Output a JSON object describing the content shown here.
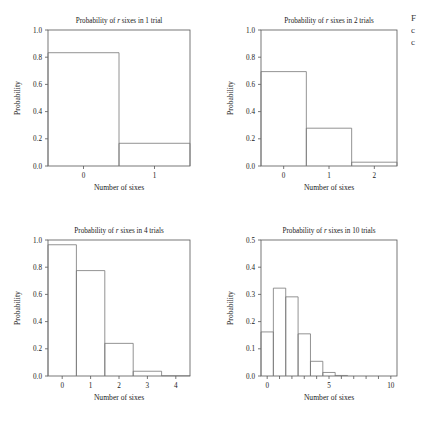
{
  "figure": {
    "background": "#ffffff",
    "stroke_color": "#555555",
    "bar_stroke_color": "#777777"
  },
  "edge_fragment": {
    "line1": "F",
    "line2": "c",
    "line3": "c"
  },
  "chart_data": [
    {
      "type": "bar",
      "title_prefix": "Probability of ",
      "title_italic": "r",
      "title_suffix": " sixes in 1 trial",
      "title": "Probability of r sixes in 1 trial",
      "xlabel": "Number of sixes",
      "ylabel": "Probability",
      "categories": [
        0,
        1
      ],
      "values": [
        0.833,
        0.167
      ],
      "xlim": [
        -0.5,
        1.5
      ],
      "ylim": [
        0.0,
        1.0
      ],
      "xticks": [
        0,
        1
      ],
      "xticklabels": [
        "0",
        "1"
      ],
      "yticks": [
        0.0,
        0.2,
        0.4,
        0.6,
        0.8,
        1.0
      ],
      "yticklabels": [
        "0.0",
        "0.2",
        "0.4",
        "0.6",
        "0.8",
        "1.0"
      ],
      "grid": false,
      "legend": "none"
    },
    {
      "type": "bar",
      "title_prefix": "Probability of ",
      "title_italic": "r",
      "title_suffix": " sixes in 2 trials",
      "title": "Probability of r sixes in 2 trials",
      "xlabel": "Number of sixes",
      "ylabel": "Probability",
      "categories": [
        0,
        1,
        2
      ],
      "values": [
        0.694,
        0.278,
        0.028
      ],
      "xlim": [
        -0.5,
        2.5
      ],
      "ylim": [
        0.0,
        1.0
      ],
      "xticks": [
        0,
        1,
        2
      ],
      "xticklabels": [
        "0",
        "1",
        "2"
      ],
      "yticks": [
        0.0,
        0.2,
        0.4,
        0.6,
        0.8,
        1.0
      ],
      "yticklabels": [
        "0.0",
        "0.2",
        "0.4",
        "0.6",
        "0.8",
        "1.0"
      ],
      "grid": false,
      "legend": "none"
    },
    {
      "type": "bar",
      "title_prefix": "Probability of ",
      "title_italic": "r",
      "title_suffix": " sixes in 4 trials",
      "title": "Probability of r sixes in 4 trials",
      "xlabel": "Number of sixes",
      "ylabel": "Probability",
      "categories": [
        0,
        1,
        2,
        3,
        4
      ],
      "values": [
        0.965,
        0.775,
        0.24,
        0.035,
        0.002
      ],
      "xlim": [
        -0.5,
        4.5
      ],
      "ylim": [
        0.0,
        1.0
      ],
      "xticks": [
        0,
        1,
        2,
        3,
        4
      ],
      "xticklabels": [
        "0",
        "1",
        "2",
        "3",
        "4"
      ],
      "yticks": [
        0.0,
        0.2,
        0.4,
        0.6,
        0.8,
        1.0
      ],
      "yticklabels": [
        "0.0",
        "0.2",
        "0.4",
        "0.6",
        "0.8",
        "1.0"
      ],
      "grid": false,
      "legend": "none"
    },
    {
      "type": "bar",
      "title_prefix": "Probability of ",
      "title_italic": "r",
      "title_suffix": " sixes in 10 trials",
      "title": "Probability of r sixes in 10 trials",
      "xlabel": "Number of sixes",
      "ylabel": "Probability",
      "categories": [
        0,
        1,
        2,
        3,
        4,
        5,
        6,
        7,
        8,
        9,
        10
      ],
      "values": [
        0.162,
        0.323,
        0.291,
        0.155,
        0.054,
        0.013,
        0.002,
        0.0,
        0.0,
        0.0,
        0.0
      ],
      "xlim": [
        -0.5,
        10.5
      ],
      "ylim": [
        0.0,
        0.5
      ],
      "xticks": [
        0,
        1,
        2,
        3,
        4,
        5,
        6,
        7,
        8,
        9,
        10
      ],
      "xticklabels": [
        "0",
        "",
        "",
        "",
        "",
        "5",
        "",
        "",
        "",
        "",
        "10"
      ],
      "yticks": [
        0.0,
        0.1,
        0.2,
        0.3,
        0.4,
        0.5
      ],
      "yticklabels": [
        "0.0",
        "0.1",
        "0.2",
        "0.3",
        "0.4",
        "0.5"
      ],
      "grid": false,
      "legend": "none"
    }
  ]
}
